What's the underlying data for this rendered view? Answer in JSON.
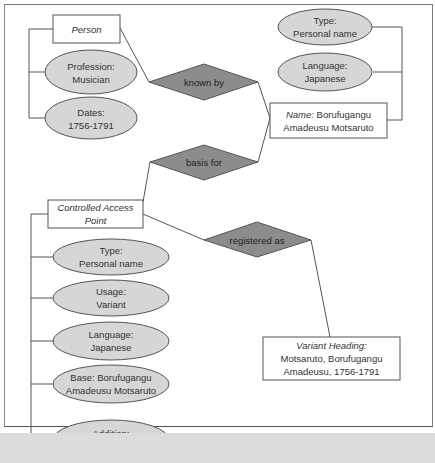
{
  "diagram": {
    "entities": {
      "person": {
        "label": "Person"
      },
      "name": {
        "label_italic": "Name:",
        "label": " Borufugangu\nAmadeusu Motsaruto"
      },
      "controlled_access_point": {
        "label": "Controlled Access\nPoint"
      },
      "variant_heading": {
        "label_italic": "Variant Heading:",
        "label": "Motsaruto,  Borufugangu\nAmadeusu, 1756-1791"
      }
    },
    "relationships": {
      "known_by": "known by",
      "basis_for": "basis for",
      "registered_as": "registered as"
    },
    "attributes": {
      "person": [
        "Profession:\nMusician",
        "Dates:\n1756-1791"
      ],
      "name": [
        "Type:\nPersonal name",
        "Language:\nJapanese"
      ],
      "controlled_access_point": [
        "Type:\nPersonal name",
        "Usage:\nVariant",
        "Language:\nJapanese",
        "Base:  Borufugangu\nAmadeusu Motsaruto",
        "Addition:\n1756 -1791"
      ]
    },
    "colors": {
      "attribute_fill": "#d6d6d6",
      "relationship_fill": "#8c8c8c",
      "line": "#555555"
    }
  }
}
